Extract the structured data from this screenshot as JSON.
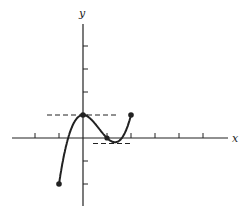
{
  "figure": {
    "type": "function-graph",
    "function": "f(x) = x^3 - 2x^2 + 1",
    "axes": {
      "x_label": "x",
      "y_label": "y",
      "x_ticks": [
        -3,
        -2,
        -1,
        1,
        2,
        3,
        4,
        5
      ],
      "y_ticks": [
        -2,
        -1,
        1,
        2,
        3,
        4
      ]
    },
    "marked_points": [
      {
        "x": -1,
        "y": -2
      },
      {
        "x": 0,
        "y": 1
      },
      {
        "x": 1,
        "y": 0
      },
      {
        "x": 2,
        "y": 1
      }
    ],
    "tangent_lines": [
      {
        "y": 1,
        "from_x": -1.5,
        "to_x": 1.4,
        "note": "horizontal tangent at local max"
      },
      {
        "y": -0.185,
        "from_x": 0.4,
        "to_x": 2.0,
        "note": "horizontal tangent at local min"
      }
    ],
    "colors": {
      "stroke": "#222222",
      "background": "#ffffff"
    }
  }
}
